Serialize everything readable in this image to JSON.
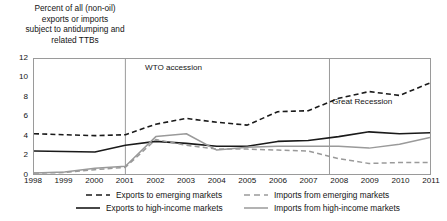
{
  "chart_data": {
    "type": "line",
    "title": "",
    "ylabel": "Percent of all (non-oil) exports or imports subject to antidumping and related TTBs",
    "ylabel_lines": [
      "Percent of all (non-oil)",
      "exports or imports",
      "subject to antidumping and",
      "related TTBs"
    ],
    "xlabel": "",
    "x": [
      1998,
      1999,
      2000,
      2001,
      2002,
      2003,
      2004,
      2005,
      2006,
      2007,
      2008,
      2009,
      2010,
      2011
    ],
    "xticklabels": [
      "1998",
      "1999",
      "2000",
      "2001",
      "2002",
      "2003",
      "2004",
      "2005",
      "2006",
      "2007",
      "2008",
      "2009",
      "2010",
      "2011"
    ],
    "ylim": [
      0,
      12
    ],
    "yticks": [
      0,
      2,
      4,
      6,
      8,
      10,
      12
    ],
    "yticklabels": [
      "0",
      "2",
      "4",
      "6",
      "8",
      "10",
      "12"
    ],
    "xlim": [
      1998,
      2011
    ],
    "grid": false,
    "legend_position": "below",
    "series": [
      {
        "name": "Exports to emerging markets",
        "key": "exports-emerging",
        "color": "#1a1a1a",
        "style": "dashed",
        "width": 1.6,
        "values": [
          4.2,
          4.1,
          4.0,
          4.1,
          5.2,
          5.8,
          5.4,
          5.1,
          6.5,
          6.6,
          7.9,
          8.6,
          8.2,
          9.5
        ]
      },
      {
        "name": "Exports to high-income markets",
        "key": "exports-high-income",
        "color": "#1a1a1a",
        "style": "solid",
        "width": 1.6,
        "values": [
          2.4,
          2.35,
          2.3,
          3.0,
          3.4,
          3.2,
          2.9,
          2.9,
          3.4,
          3.5,
          3.9,
          4.4,
          4.2,
          4.3
        ]
      },
      {
        "name": "Imports from emerging markets",
        "key": "imports-emerging",
        "color": "#9a9a9a",
        "style": "dashed",
        "width": 1.5,
        "values": [
          0.1,
          0.15,
          0.45,
          0.7,
          3.6,
          3.0,
          2.6,
          2.6,
          2.5,
          2.4,
          1.6,
          1.1,
          1.2,
          1.2
        ]
      },
      {
        "name": "Imports from high-income markets",
        "key": "imports-high-income",
        "color": "#9a9a9a",
        "style": "solid",
        "width": 1.5,
        "values": [
          0.1,
          0.2,
          0.6,
          0.8,
          3.9,
          4.2,
          2.5,
          2.8,
          2.9,
          2.9,
          2.9,
          2.7,
          3.1,
          3.8
        ]
      }
    ],
    "annotations": [
      {
        "key": "wto-accession",
        "label": "WTO accession",
        "x": 2001,
        "vline": true
      },
      {
        "key": "great-recession",
        "label": "Great Recession",
        "x": 2007.7,
        "vline": true
      }
    ],
    "annotation_line_color": "#9a9a9a"
  }
}
